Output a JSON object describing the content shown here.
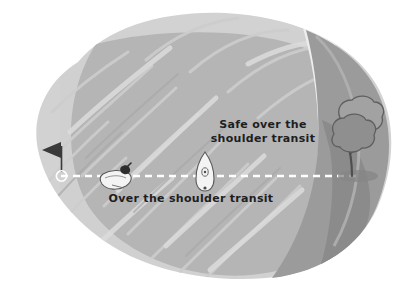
{
  "diagram": {
    "labels": {
      "safe_transit_line1": "Safe over the",
      "safe_transit_line2": "shoulder transit",
      "over_transit": "Over the shoulder transit"
    },
    "icons": {
      "flag": "flag-marker-icon",
      "buoy": "buoy-ring-icon",
      "boat_perspective": "boat-perspective-icon",
      "boat_plan": "boat-plan-view-icon",
      "tree": "tree-icon",
      "transit_line": "dashed-transit-line-icon"
    },
    "colors": {
      "background": "#ffffff",
      "water_light": "#d2d2d2",
      "water_mid": "#b6b6b6",
      "water_streak": "#c9c9c9",
      "shore_pale": "#e4e4e4",
      "land_dark": "#9b9b9b",
      "land_shadow": "#8b8b8b",
      "tree_canopy": "#8f8f8f",
      "tree_outline": "#5f5f5f",
      "boat_white": "#f2f2f2",
      "boat_outline": "#5a5a5a",
      "flag_dark": "#3a3a3a",
      "dash_white": "#ffffff",
      "text": "#1e1e1e"
    },
    "transit_line": {
      "y": 176,
      "x_start": 61,
      "x_end": 356,
      "style": "dashed",
      "color": "#ffffff"
    },
    "markers": [
      {
        "name": "flag-marker",
        "x": 61,
        "y": 150
      },
      {
        "name": "buoy-ring",
        "x": 61,
        "y": 176
      },
      {
        "name": "boat-perspective",
        "x": 116,
        "y": 177
      },
      {
        "name": "boat-plan-view",
        "x": 205,
        "y": 172
      },
      {
        "name": "tree",
        "x": 352,
        "y": 140
      }
    ]
  }
}
